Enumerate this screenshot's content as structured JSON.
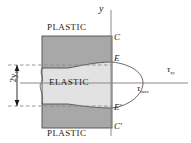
{
  "figure": {
    "labels": {
      "axis_y": "y",
      "axis_tau_xy": "τ",
      "axis_tau_xy_sub": "xy",
      "tau_max": "τ",
      "tau_max_sub": "max",
      "point_C": "C",
      "point_E": "E",
      "point_E_prime": "E′",
      "point_C_prime": "C′",
      "region_plastic_top": "PLASTIC",
      "region_elastic": "ELASTIC",
      "region_plastic_bottom": "PLASTIC",
      "dimension_2yY": "2y",
      "dimension_2yY_sub": "Y"
    },
    "colors": {
      "plastic_fill": "#a8a8a8",
      "elastic_fill": "#e2e2e2",
      "outline": "#4d4d4d",
      "curve": "#555555",
      "axis": "#8a8a8a",
      "dashed": "#8a8a8a",
      "text": "#1a1a1a"
    },
    "geometry": {
      "block_left": 42,
      "block_right": 112,
      "block_top": 36,
      "block_bottom": 128,
      "elastic_top_left": 68,
      "elastic_top_right": 62,
      "elastic_bottom_left": 104,
      "elastic_bottom_right": 108,
      "axis_y_x": 111,
      "axis_y_top": 10,
      "axis_y_bottom": 136,
      "axis_tau_y": 83,
      "axis_tau_left": 20,
      "axis_tau_right": 188,
      "parabola_apex_x": 143,
      "parabola_apex_y": 83,
      "dim_arrow_x": 17,
      "dim_top_y": 65,
      "dim_bottom_y": 106
    }
  }
}
